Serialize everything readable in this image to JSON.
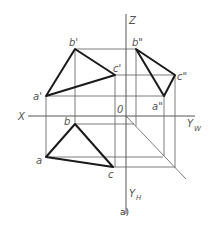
{
  "figure": {
    "caption": "a)",
    "axes": {
      "x_label": "X",
      "z_label": "Z",
      "origin_label": "0",
      "yw_label": "Y",
      "yw_sub": "W",
      "yh_label": "Y",
      "yh_sub": "H"
    },
    "points": {
      "front_view": {
        "a": "a'",
        "b": "b'",
        "c": "c'"
      },
      "side_view": {
        "a": "a\"",
        "b": "b\"",
        "c": "c\""
      },
      "top_view": {
        "a": "a",
        "b": "b",
        "c": "c"
      }
    },
    "colors": {
      "outline": "#1a1a1a",
      "construction": "#5a5a5a",
      "label": "#555555"
    }
  }
}
